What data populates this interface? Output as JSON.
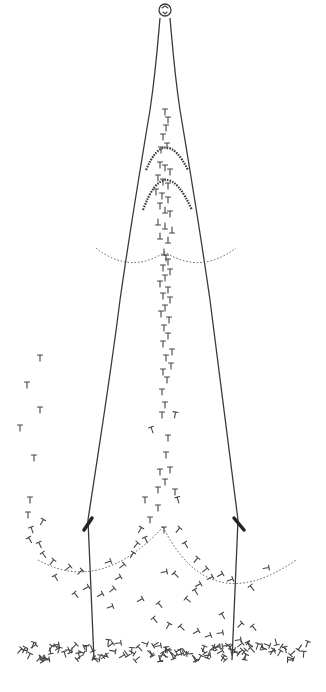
{
  "diagram": {
    "colors": {
      "background": "#ffffff",
      "stroke": "#3a3a3a"
    },
    "knob": {
      "cx": 165,
      "cy": 10,
      "r": 6
    },
    "outer_left": "M160,18 C158,40 156,70 150,110 C140,170 130,230 120,300 C110,380 100,440 88,520",
    "outer_right": "M170,18 C172,40 174,70 180,110 C190,170 200,230 210,300 C220,380 228,440 238,520",
    "lower_left": "M88,520 L94,660",
    "lower_right": "M238,520 L232,660",
    "clips": [
      {
        "x1": 84,
        "y1": 530,
        "x2": 92,
        "y2": 518
      },
      {
        "x1": 234,
        "y1": 518,
        "x2": 244,
        "y2": 530
      }
    ],
    "beaded_arcs": [
      "M146,170 Q165,125 188,170",
      "M143,210 Q165,150 192,210"
    ],
    "dotted_arcs": [
      "M96,248 Q130,275 165,252 Q200,275 236,248",
      "M38,560 Q100,595 163,527",
      "M163,527 Q210,620 296,560"
    ],
    "particles": [
      [
        165,
        112,
        0
      ],
      [
        168,
        120,
        0
      ],
      [
        166,
        128,
        0
      ],
      [
        163,
        137,
        0
      ],
      [
        167,
        146,
        0
      ],
      [
        161,
        150,
        0
      ],
      [
        160,
        165,
        0
      ],
      [
        165,
        168,
        0
      ],
      [
        170,
        172,
        0
      ],
      [
        158,
        178,
        0
      ],
      [
        163,
        182,
        0
      ],
      [
        168,
        186,
        0
      ],
      [
        156,
        192,
        0
      ],
      [
        162,
        196,
        0
      ],
      [
        168,
        200,
        0
      ],
      [
        160,
        206,
        0
      ],
      [
        165,
        210,
        180
      ],
      [
        170,
        214,
        0
      ],
      [
        158,
        222,
        180
      ],
      [
        165,
        226,
        180
      ],
      [
        172,
        230,
        180
      ],
      [
        160,
        236,
        180
      ],
      [
        168,
        240,
        180
      ],
      [
        164,
        252,
        180
      ],
      [
        166,
        258,
        0
      ],
      [
        168,
        262,
        0
      ],
      [
        163,
        268,
        0
      ],
      [
        170,
        272,
        0
      ],
      [
        165,
        278,
        0
      ],
      [
        160,
        284,
        0
      ],
      [
        168,
        290,
        0
      ],
      [
        163,
        296,
        0
      ],
      [
        170,
        300,
        0
      ],
      [
        165,
        308,
        0
      ],
      [
        161,
        314,
        0
      ],
      [
        169,
        320,
        0
      ],
      [
        164,
        328,
        0
      ],
      [
        168,
        336,
        0
      ],
      [
        163,
        344,
        0
      ],
      [
        172,
        352,
        0
      ],
      [
        166,
        358,
        0
      ],
      [
        171,
        366,
        0
      ],
      [
        163,
        372,
        0
      ],
      [
        167,
        380,
        0
      ],
      [
        162,
        392,
        0
      ],
      [
        165,
        405,
        0
      ],
      [
        162,
        415,
        0
      ],
      [
        175,
        415,
        10
      ],
      [
        152,
        430,
        -20
      ],
      [
        168,
        438,
        0
      ],
      [
        166,
        455,
        0
      ],
      [
        160,
        472,
        0
      ],
      [
        170,
        470,
        0
      ],
      [
        165,
        482,
        0
      ],
      [
        158,
        490,
        0
      ],
      [
        175,
        492,
        0
      ],
      [
        178,
        500,
        -15
      ],
      [
        40,
        358,
        0
      ],
      [
        27,
        385,
        0
      ],
      [
        40,
        410,
        0
      ],
      [
        20,
        428,
        0
      ],
      [
        34,
        458,
        0
      ],
      [
        30,
        500,
        0
      ],
      [
        28,
        515,
        0
      ],
      [
        42,
        522,
        30
      ],
      [
        32,
        530,
        -20
      ],
      [
        30,
        540,
        -30
      ],
      [
        40,
        545,
        -25
      ],
      [
        44,
        555,
        -35
      ],
      [
        52,
        562,
        40
      ],
      [
        68,
        568,
        50
      ],
      [
        80,
        572,
        45
      ],
      [
        56,
        578,
        -30
      ],
      [
        145,
        500,
        0
      ],
      [
        158,
        508,
        0
      ],
      [
        150,
        520,
        0
      ],
      [
        140,
        530,
        30
      ],
      [
        146,
        540,
        -25
      ],
      [
        136,
        545,
        40
      ],
      [
        132,
        555,
        30
      ],
      [
        122,
        566,
        50
      ],
      [
        118,
        578,
        60
      ],
      [
        108,
        562,
        70
      ],
      [
        86,
        588,
        60
      ],
      [
        76,
        595,
        -40
      ],
      [
        100,
        595,
        60
      ],
      [
        112,
        590,
        50
      ],
      [
        164,
        530,
        0
      ],
      [
        178,
        530,
        40
      ],
      [
        186,
        545,
        -30
      ],
      [
        196,
        560,
        40
      ],
      [
        205,
        570,
        50
      ],
      [
        210,
        578,
        60
      ],
      [
        220,
        575,
        60
      ],
      [
        230,
        580,
        70
      ],
      [
        266,
        568,
        80
      ],
      [
        252,
        588,
        -40
      ],
      [
        164,
        572,
        80
      ],
      [
        176,
        575,
        -45
      ],
      [
        196,
        592,
        -30
      ],
      [
        198,
        585,
        60
      ],
      [
        188,
        600,
        -50
      ],
      [
        160,
        605,
        -40
      ],
      [
        140,
        600,
        60
      ],
      [
        110,
        607,
        70
      ],
      [
        155,
        620,
        -40
      ],
      [
        168,
        626,
        30
      ],
      [
        182,
        628,
        -45
      ],
      [
        196,
        632,
        60
      ],
      [
        208,
        636,
        70
      ],
      [
        220,
        633,
        80
      ],
      [
        223,
        616,
        -30
      ],
      [
        240,
        625,
        45
      ],
      [
        238,
        640,
        80
      ],
      [
        244,
        652,
        40
      ],
      [
        254,
        628,
        -40
      ],
      [
        158,
        646,
        80
      ],
      [
        170,
        652,
        -40
      ],
      [
        220,
        652,
        60
      ],
      [
        240,
        645,
        50
      ]
    ],
    "ground_particles_y": [
      642,
      660
    ],
    "ground_x_range": [
      18,
      310
    ]
  }
}
